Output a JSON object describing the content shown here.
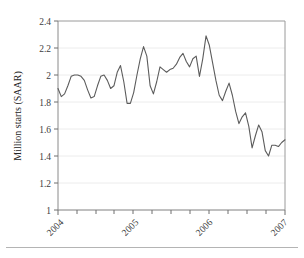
{
  "chart_data": {
    "type": "line",
    "title": "",
    "subtitle": "",
    "xlabel": "",
    "ylabel": "Million starts (SAAR)",
    "ylim": [
      1,
      2.4
    ],
    "ytick_labels": [
      "1",
      "1.2",
      "1.4",
      "1.6",
      "1.8",
      "2",
      "2.2",
      "2.4"
    ],
    "ytick_values": [
      1,
      1.2,
      1.4,
      1.6,
      1.8,
      2,
      2.2,
      2.4
    ],
    "xtick_labels": [
      "2004",
      "2005",
      "2006",
      "2007"
    ],
    "xtick_values": [
      2004,
      2005,
      2006,
      2007
    ],
    "xlim": [
      2003.92,
      2007.0
    ],
    "grid": "horizontal",
    "legend": "none",
    "line_color": "#5c5c5c",
    "series": [
      {
        "name": "Housing starts",
        "units": "Million starts (SAAR)",
        "x": [
          2003.92,
          2004.0,
          2004.08,
          2004.17,
          2004.25,
          2004.33,
          2004.42,
          2004.5,
          2004.58,
          2004.67,
          2004.75,
          2004.83,
          2004.92,
          2005.0,
          2005.08,
          2005.17,
          2005.25,
          2005.33,
          2005.42,
          2005.5,
          2005.58,
          2005.67,
          2005.75,
          2005.83,
          2005.92,
          2006.0,
          2006.08,
          2006.17,
          2006.25,
          2006.33,
          2006.42,
          2006.5,
          2006.58,
          2006.67,
          2006.75,
          2006.83,
          2006.92,
          2007.0
        ],
        "values": [
          1.9,
          1.84,
          1.9,
          1.99,
          2.0,
          1.99,
          1.92,
          1.83,
          1.87,
          1.99,
          2.0,
          1.9,
          1.97,
          2.07,
          1.88,
          1.79,
          1.93,
          2.06,
          2.21,
          2.05,
          1.86,
          2.06,
          2.03,
          2.04,
          2.06,
          2.12,
          2.16,
          2.07,
          2.11,
          2.13,
          1.99,
          2.29,
          2.17,
          1.96,
          1.81,
          1.94,
          1.84,
          1.73
        ]
      }
    ],
    "values_detail": [
      1.9,
      1.84,
      1.86,
      1.92,
      1.99,
      2.0,
      2.0,
      1.99,
      1.96,
      1.89,
      1.83,
      1.84,
      1.92,
      1.99,
      2.0,
      1.96,
      1.9,
      1.92,
      2.02,
      2.07,
      1.95,
      1.79,
      1.79,
      1.87,
      2.0,
      2.12,
      2.21,
      2.14,
      1.92,
      1.86,
      1.95,
      2.06,
      2.04,
      2.02,
      2.04,
      2.05,
      2.08,
      2.13,
      2.16,
      2.1,
      2.06,
      2.12,
      2.14,
      1.99,
      2.12,
      2.29,
      2.22,
      2.09,
      1.96,
      1.85,
      1.81,
      1.88,
      1.94,
      1.85,
      1.73,
      1.64,
      1.69,
      1.72,
      1.62,
      1.46,
      1.55,
      1.63,
      1.58,
      1.44,
      1.4,
      1.48,
      1.48,
      1.47,
      1.5,
      1.52
    ],
    "notes": {
      "min_value": 1.4,
      "max_value": 2.29,
      "start_value": 1.9,
      "end_value": 1.52
    }
  },
  "axis": {
    "y_title": "Million starts (SAAR)"
  }
}
